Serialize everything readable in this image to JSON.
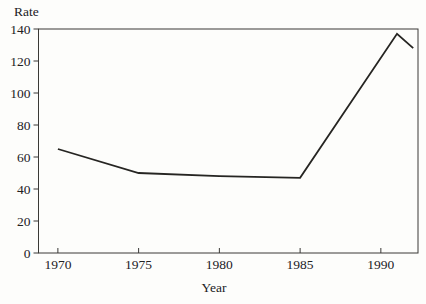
{
  "chart": {
    "y_axis_title": "Rate",
    "x_axis_title": "Year"
  },
  "chart_data": {
    "type": "line",
    "title": "",
    "xlabel": "Year",
    "ylabel": "Rate",
    "xlim": [
      1968.8,
      1992.3
    ],
    "ylim": [
      0,
      140
    ],
    "x_ticks": [
      1970,
      1975,
      1980,
      1985,
      1990
    ],
    "y_ticks": [
      0,
      20,
      40,
      60,
      80,
      100,
      120,
      140
    ],
    "grid": false,
    "legend": "none",
    "frame": "full-box",
    "axis_color": "#3a3936",
    "line_color": "#262522",
    "series": [
      {
        "name": "rate",
        "points": [
          [
            1970,
            65
          ],
          [
            1975,
            50
          ],
          [
            1980,
            48
          ],
          [
            1985,
            47
          ],
          [
            1991,
            137
          ],
          [
            1992,
            128
          ]
        ]
      }
    ]
  }
}
